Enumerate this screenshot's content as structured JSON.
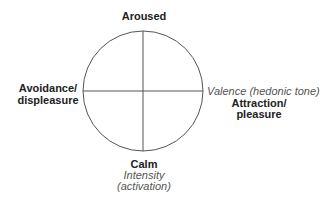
{
  "diagram": {
    "type": "circumplex",
    "colors": {
      "line": "#555555",
      "bold_text": "#222222",
      "italic_text": "#555555"
    },
    "top_label": "Aroused",
    "bottom_label": "Calm",
    "left_label": {
      "line1": "Avoidance/",
      "line2": "displeasure"
    },
    "right_label": {
      "line1": "Attraction/",
      "line2": "pleasure"
    },
    "horizontal_axis_label": "Valence (hedonic tone)",
    "vertical_axis_label": {
      "line1": "Intensity",
      "line2": "(activation)"
    }
  }
}
